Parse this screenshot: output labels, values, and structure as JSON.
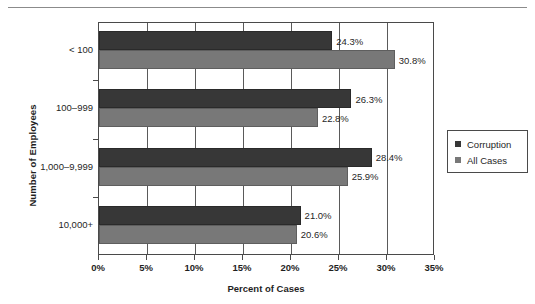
{
  "chart_data": {
    "type": "bar",
    "orientation": "horizontal",
    "title": "",
    "xlabel": "Percent of Cases",
    "ylabel": "Number of Employees",
    "categories": [
      "< 100",
      "100–999",
      "1,000–9,999",
      "10,000+"
    ],
    "series": [
      {
        "name": "Corruption",
        "color": "#373737",
        "values": [
          24.3,
          26.3,
          28.4,
          21.0
        ],
        "labels": [
          "24.3%",
          "26.3%",
          "28.4%",
          "21.0%"
        ]
      },
      {
        "name": "All Cases",
        "color": "#787878",
        "values": [
          30.8,
          22.8,
          25.9,
          20.6
        ],
        "labels": [
          "30.8%",
          "22.8%",
          "25.9%",
          "20.6%"
        ]
      }
    ],
    "xlim": [
      0,
      35
    ],
    "xticks": [
      0,
      5,
      10,
      15,
      20,
      25,
      30,
      35
    ],
    "xtick_labels": [
      "0%",
      "5%",
      "10%",
      "15%",
      "20%",
      "25%",
      "30%",
      "35%"
    ],
    "grid": "vertical",
    "legend_position": "right"
  },
  "legend": {
    "entries": [
      {
        "label": "Corruption"
      },
      {
        "label": "All Cases"
      }
    ]
  },
  "colors": {
    "corruption": "#373737",
    "all_cases": "#787878",
    "axis": "#4a4a4a",
    "text": "#1f1f1f"
  }
}
